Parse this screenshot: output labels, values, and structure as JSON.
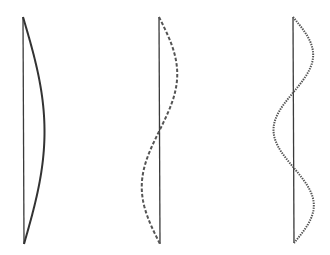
{
  "diagram": {
    "background": "#ffffff",
    "stroke_color": "#333333",
    "strings": [
      {
        "name": "mode-1",
        "harmonic": 1,
        "loops": 1,
        "axis_x": 23,
        "top_y": 17,
        "bottom_y": 244,
        "amplitude_px": 21,
        "curve_style": "solid",
        "nodes_y": [
          17,
          244
        ],
        "antinodes_y": [
          130
        ]
      },
      {
        "name": "mode-2",
        "harmonic": 2,
        "loops": 2,
        "axis_x": 159,
        "top_y": 17,
        "bottom_y": 244,
        "amplitude_px": 18,
        "curve_style": "dashed",
        "nodes_y": [
          17,
          131,
          244
        ],
        "antinodes_y": [
          74,
          187
        ]
      },
      {
        "name": "mode-3",
        "harmonic": 3,
        "loops": 3,
        "axis_x": 293,
        "top_y": 17,
        "bottom_y": 243,
        "amplitude_px": 20,
        "curve_style": "dotted",
        "nodes_y": [
          17,
          94,
          166,
          243
        ],
        "antinodes_y": [
          55,
          130,
          205
        ]
      }
    ]
  }
}
